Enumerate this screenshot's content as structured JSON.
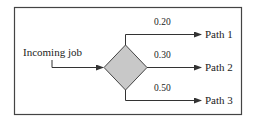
{
  "diagram": {
    "type": "decision-branch",
    "source_label": "Incoming job",
    "decision_node": {
      "shape": "diamond",
      "fill": "#c8c8c8",
      "stroke": "#444444"
    },
    "branches": [
      {
        "probability": "0.20",
        "target": "Path 1"
      },
      {
        "probability": "0.30",
        "target": "Path 2"
      },
      {
        "probability": "0.50",
        "target": "Path 3"
      }
    ]
  },
  "colors": {
    "line": "#333333",
    "frame": "#444444",
    "text": "#222222",
    "background": "#ffffff"
  }
}
